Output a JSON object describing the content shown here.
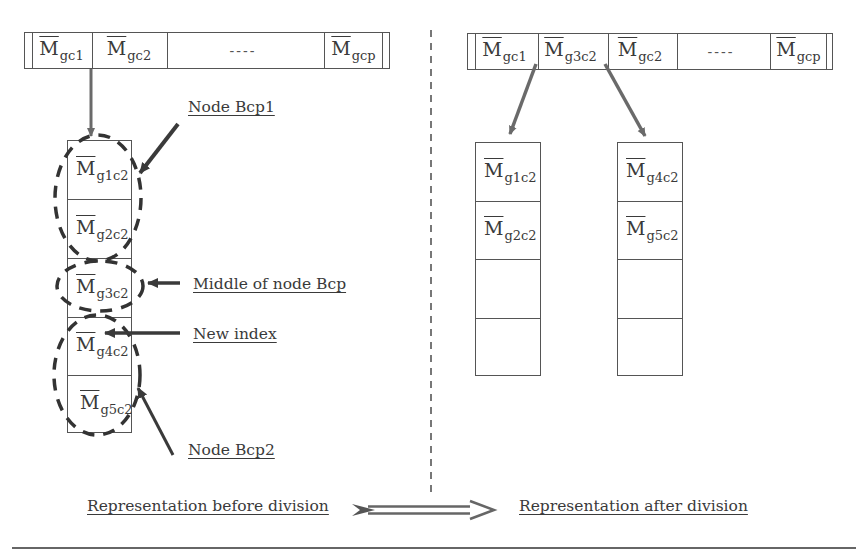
{
  "before": {
    "index_bar": {
      "cells": [
        {
          "base": "M",
          "sub": "gc1"
        },
        {
          "base": "M",
          "sub": "gc2"
        },
        {
          "ellipsis": "----"
        },
        {
          "base": "M",
          "sub": "gcp"
        }
      ]
    },
    "node_column": {
      "rows": [
        {
          "base": "M",
          "sub": "g1c2"
        },
        {
          "base": "M",
          "sub": "g2c2"
        },
        {
          "base": "M",
          "sub": "g3c2"
        },
        {
          "base": "M",
          "sub": "g4c2"
        },
        {
          "base": "M",
          "sub": "g5c2"
        }
      ]
    },
    "annotations": {
      "node_bcp1": "Node Bcp1",
      "middle": "Middle of node Bcp",
      "new_index": "New index",
      "node_bcp2": "Node Bcp2"
    }
  },
  "after": {
    "index_bar": {
      "cells": [
        {
          "base": "M",
          "sub": "gc1"
        },
        {
          "base": "M",
          "sub": "g3c2"
        },
        {
          "base": "M",
          "sub": "gc2"
        },
        {
          "ellipsis": "----"
        },
        {
          "base": "M",
          "sub": "gcp"
        }
      ]
    },
    "left_node": {
      "rows": [
        {
          "base": "M",
          "sub": "g1c2"
        },
        {
          "base": "M",
          "sub": "g2c2"
        },
        {
          "base": "",
          "sub": ""
        },
        {
          "base": "",
          "sub": ""
        }
      ]
    },
    "right_node": {
      "rows": [
        {
          "base": "M",
          "sub": "g4c2"
        },
        {
          "base": "M",
          "sub": "g5c2"
        },
        {
          "base": "",
          "sub": ""
        },
        {
          "base": "",
          "sub": ""
        }
      ]
    }
  },
  "footer": {
    "before_label": "Representation before division",
    "after_label": "Representation after division"
  },
  "colors": {
    "line": "#555555",
    "arrow": "#6a6a6a",
    "text": "#3a3a3a"
  }
}
